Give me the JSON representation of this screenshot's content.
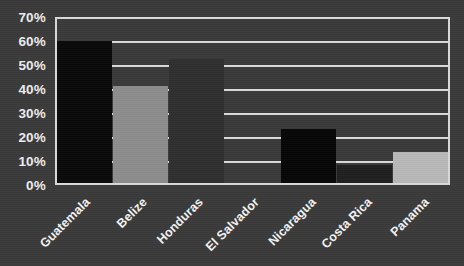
{
  "chart_data": {
    "type": "bar",
    "title": "",
    "xlabel": "",
    "ylabel": "",
    "categories": [
      "Guatemala",
      "Belize",
      "Honduras",
      "El Salvador",
      "Nicaragua",
      "Costa Rica",
      "Panama"
    ],
    "values": [
      59,
      40.5,
      51.5,
      0,
      22.5,
      7.5,
      13
    ],
    "value_labels": [
      "59%",
      "40.5%",
      "51.5%",
      "0%",
      "22.5%",
      "7.5%",
      "13%"
    ],
    "bar_colors": [
      "#090909",
      "#8d8d8d",
      "#2f2f2f",
      "#3a3a3a",
      "#070707",
      "#1f1f1f",
      "#b8b8b8"
    ],
    "ylim": [
      0,
      70
    ],
    "ytick_values": [
      70,
      60,
      50,
      40,
      30,
      20,
      10,
      0
    ],
    "yticks": [
      "70%",
      "60%",
      "50%",
      "40%",
      "30%",
      "20%",
      "10%",
      "0%"
    ],
    "grid": true,
    "legend": "none",
    "background_color": "#3a3a3a",
    "gridline_color": "#d9d9d9",
    "text_color": "#f2f2f2"
  }
}
